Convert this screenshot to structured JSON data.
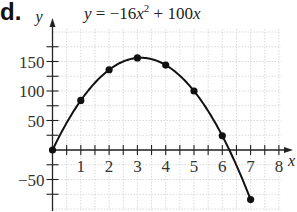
{
  "problem": {
    "label": "d."
  },
  "chart_data": {
    "type": "line",
    "equation": {
      "lhs": "y",
      "eq": "=",
      "coef": "−16",
      "var": "x",
      "exp": "2",
      "plus": "+",
      "lin": "100",
      "var2": "x"
    },
    "xlabel": "x",
    "ylabel": "y",
    "x": [
      0,
      1,
      2,
      3,
      4,
      5,
      6,
      7
    ],
    "values": [
      0,
      84,
      136,
      156,
      144,
      100,
      24,
      -84
    ],
    "series": [
      {
        "name": "y = −16x² + 100x",
        "x": [
          0,
          1,
          2,
          3,
          4,
          5,
          6,
          7
        ],
        "values": [
          0,
          84,
          136,
          156,
          144,
          100,
          24,
          -84
        ]
      }
    ],
    "xticks": [
      "1",
      "2",
      "3",
      "4",
      "5",
      "6",
      "7",
      "8"
    ],
    "yticks": [
      "−50",
      "50",
      "100",
      "150"
    ],
    "xlim": [
      0,
      8.2
    ],
    "ylim": [
      -100,
      205
    ],
    "grid": true,
    "markers": true
  }
}
